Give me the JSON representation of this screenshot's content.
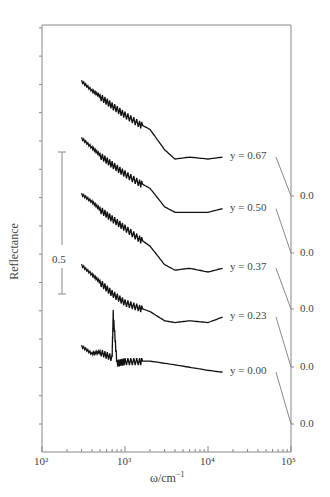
{
  "chart_data": {
    "type": "line",
    "title": "",
    "xlabel": "ω/cm⁻¹",
    "ylabel": "Reflectance",
    "xscale": "log",
    "xlim": [
      100,
      100000
    ],
    "x_tick_labels": [
      "10²",
      "10³",
      "10⁴",
      "10⁵"
    ],
    "scale_bar_label": "0.5",
    "right_axis_labels": [
      "0.0",
      "0.0",
      "0.0",
      "0.0",
      "0.0"
    ],
    "grid": false,
    "series": [
      {
        "name": "y = 0.67",
        "offset_zero_label": "0.0",
        "x": [
          300,
          400,
          500,
          700,
          1000,
          1500,
          2000,
          3000,
          4000,
          6000,
          10000,
          15000
        ],
        "values": [
          0.62,
          0.57,
          0.54,
          0.49,
          0.44,
          0.39,
          0.36,
          0.25,
          0.2,
          0.21,
          0.2,
          0.21
        ]
      },
      {
        "name": "y = 0.50",
        "offset_zero_label": "0.0",
        "x": [
          300,
          400,
          500,
          700,
          1000,
          1500,
          2000,
          3000,
          4000,
          6000,
          10000,
          15000
        ],
        "values": [
          0.62,
          0.57,
          0.53,
          0.48,
          0.43,
          0.38,
          0.35,
          0.25,
          0.22,
          0.22,
          0.22,
          0.24
        ]
      },
      {
        "name": "y = 0.37",
        "offset_zero_label": "0.0",
        "x": [
          300,
          400,
          500,
          700,
          1000,
          1500,
          2000,
          3000,
          4000,
          6000,
          10000,
          15000
        ],
        "values": [
          0.62,
          0.58,
          0.54,
          0.49,
          0.44,
          0.38,
          0.34,
          0.24,
          0.21,
          0.22,
          0.2,
          0.22
        ]
      },
      {
        "name": "y = 0.23",
        "offset_zero_label": "0.0",
        "x": [
          300,
          400,
          500,
          700,
          1000,
          1500,
          2000,
          3000,
          4000,
          6000,
          10000,
          15000
        ],
        "values": [
          0.55,
          0.5,
          0.46,
          0.4,
          0.35,
          0.32,
          0.3,
          0.25,
          0.24,
          0.25,
          0.24,
          0.27
        ]
      },
      {
        "name": "y = 0.00",
        "offset_zero_label": "0.0",
        "x": [
          300,
          400,
          500,
          700,
          720,
          800,
          1000,
          1500,
          2000,
          4000,
          10000,
          15000
        ],
        "values": [
          0.42,
          0.38,
          0.39,
          0.36,
          0.6,
          0.33,
          0.34,
          0.34,
          0.34,
          0.32,
          0.29,
          0.28
        ]
      }
    ]
  }
}
